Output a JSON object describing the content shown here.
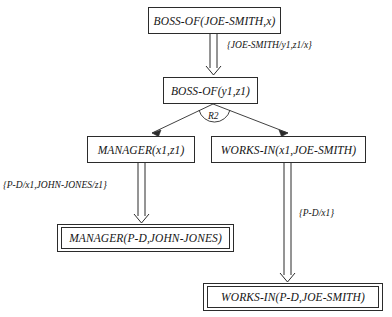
{
  "diagram": {
    "nodes": [
      {
        "id": "n1",
        "text": "BOSS-OF(JOE-SMITH,x)",
        "kind": "goal"
      },
      {
        "id": "n2",
        "text": "BOSS-OF(y1,z1)",
        "kind": "goal"
      },
      {
        "id": "n3",
        "text": "MANAGER(x1,z1)",
        "kind": "goal"
      },
      {
        "id": "n4",
        "text": "WORKS-IN(x1,JOE-SMITH)",
        "kind": "goal"
      },
      {
        "id": "n5",
        "text": "MANAGER(P-D,JOHN-JONES)",
        "kind": "fact"
      },
      {
        "id": "n6",
        "text": "WORKS-IN(P-D,JOE-SMITH)",
        "kind": "fact"
      }
    ],
    "substitutions": [
      {
        "id": "s1",
        "text": "{JOE-SMITH/y1,z1/x}"
      },
      {
        "id": "s2",
        "text": "{P-D/x1,JOHN-JONES/z1}"
      },
      {
        "id": "s3",
        "text": "{P-D/x1}"
      }
    ],
    "rule_labels": [
      {
        "id": "r1",
        "text": "R2"
      }
    ],
    "colors": {
      "line": "#2b2b2b",
      "text": "#141414",
      "background": "#ffffff"
    }
  }
}
